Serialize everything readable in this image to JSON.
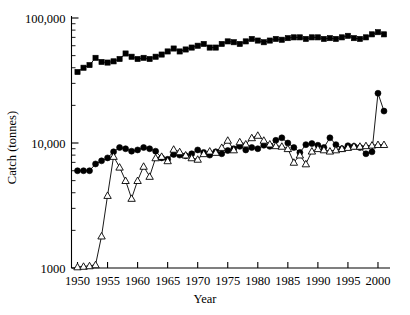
{
  "chart_data": {
    "type": "line",
    "title": "",
    "subtitle": "",
    "xlabel": "Year",
    "ylabel": "Catch (tonnes)",
    "yscale": "log",
    "xlim": [
      1949,
      2002
    ],
    "ylim": [
      1000,
      100000
    ],
    "xticks": [
      1950,
      1955,
      1960,
      1965,
      1970,
      1975,
      1980,
      1985,
      1990,
      1995,
      2000
    ],
    "xticklabels": [
      "1950",
      "1955",
      "1960",
      "1965",
      "1970",
      "1975",
      "1980",
      "1985",
      "1990",
      "1995",
      "2000"
    ],
    "yticks": [
      1000,
      10000,
      100000
    ],
    "yticklabels": [
      "1000",
      "10,000",
      "100,000"
    ],
    "grid": false,
    "legend": "none",
    "marker_color": "#000000",
    "line_color": "#000000",
    "x": [
      1950,
      1951,
      1952,
      1953,
      1954,
      1955,
      1956,
      1957,
      1958,
      1959,
      1960,
      1961,
      1962,
      1963,
      1964,
      1965,
      1966,
      1967,
      1968,
      1969,
      1970,
      1971,
      1972,
      1973,
      1974,
      1975,
      1976,
      1977,
      1978,
      1979,
      1980,
      1981,
      1982,
      1983,
      1984,
      1985,
      1986,
      1987,
      1988,
      1989,
      1990,
      1991,
      1992,
      1993,
      1994,
      1995,
      1996,
      1997,
      1998,
      1999,
      2000,
      2001
    ],
    "series": [
      {
        "name": "total-catch",
        "marker": "filled-square",
        "values": [
          37000,
          40000,
          42000,
          48000,
          44500,
          44000,
          45000,
          47000,
          52000,
          49000,
          47000,
          48000,
          47000,
          49000,
          51000,
          54000,
          57000,
          54000,
          56000,
          58000,
          60000,
          62000,
          58000,
          58000,
          62000,
          65000,
          64000,
          62000,
          65000,
          68000,
          66000,
          64000,
          66000,
          68000,
          67000,
          69000,
          70000,
          70000,
          68000,
          70000,
          70000,
          68000,
          69000,
          68000,
          70000,
          72000,
          69000,
          68000,
          70000,
          74000,
          77000,
          74000
        ]
      },
      {
        "name": "series-circles",
        "marker": "filled-circle",
        "values": [
          6000,
          6000,
          6000,
          6800,
          7200,
          7600,
          8500,
          9200,
          9000,
          8600,
          8800,
          9200,
          9000,
          8600,
          7600,
          7400,
          8100,
          8000,
          7900,
          8200,
          8800,
          8400,
          8000,
          8500,
          8200,
          8700,
          9000,
          9400,
          8800,
          9200,
          9000,
          9600,
          9400,
          10500,
          11000,
          10000,
          9200,
          8400,
          9700,
          9900,
          9600,
          9200,
          11000,
          9700,
          9000,
          9500,
          9400,
          9200,
          8200,
          8500,
          25000,
          18000
        ]
      },
      {
        "name": "series-triangles",
        "marker": "open-triangle",
        "values": [
          1020,
          1030,
          1040,
          1060,
          1800,
          3800,
          7800,
          6400,
          5000,
          3600,
          5000,
          6500,
          5400,
          7600,
          7800,
          7200,
          8900,
          8500,
          8000,
          7600,
          7400,
          8200,
          8600,
          8400,
          9200,
          10500,
          8800,
          10200,
          9800,
          11000,
          11500,
          10500,
          9800,
          9500,
          9400,
          9000,
          7000,
          8000,
          6800,
          8600,
          9000,
          8800,
          8600,
          8800,
          9000,
          9200,
          9400,
          9400,
          9500,
          9600,
          9700,
          9700
        ]
      }
    ]
  }
}
